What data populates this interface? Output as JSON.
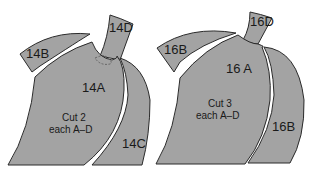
{
  "figure": {
    "colors": {
      "piece_fill": "#a3a3a3",
      "outline": "#2a2a2a",
      "background": "#ffffff"
    },
    "patterns": [
      {
        "id": "14",
        "pieces": {
          "a": "14A",
          "b": "14B",
          "c": "14C",
          "d": "14D"
        },
        "instruction_line1": "Cut 2",
        "instruction_line2": "each A–D"
      },
      {
        "id": "16",
        "pieces": {
          "a": "16 A",
          "b_top": "16B",
          "b_right": "16B",
          "d": "16D"
        },
        "instruction_line1": "Cut 3",
        "instruction_line2": "each A–D"
      }
    ]
  }
}
